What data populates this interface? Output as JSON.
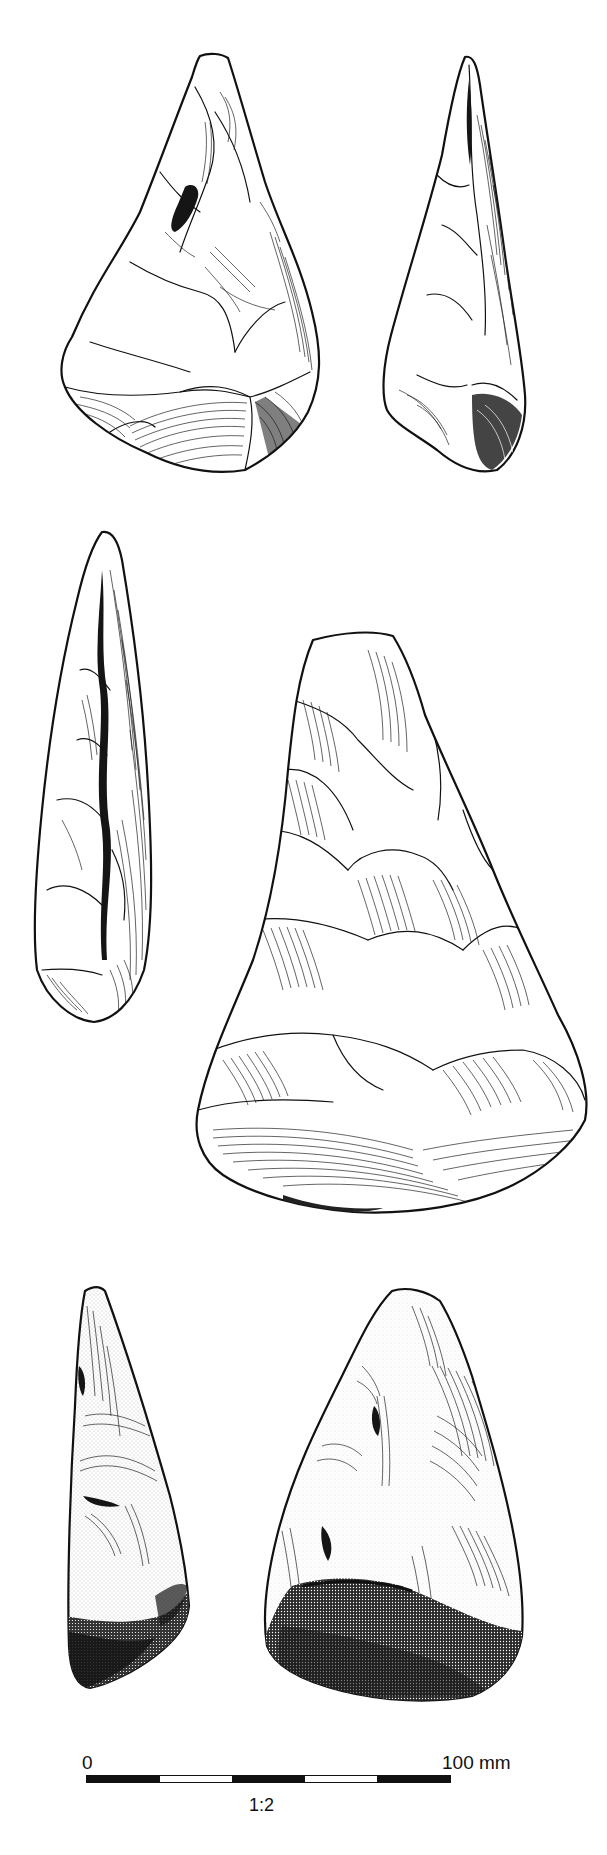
{
  "figure": {
    "artifacts": [
      {
        "id": "a1",
        "view": "face",
        "row": 1,
        "col": 1,
        "rendering": "line-hatched"
      },
      {
        "id": "a2",
        "view": "profile",
        "row": 1,
        "col": 2,
        "rendering": "line-hatched"
      },
      {
        "id": "a3",
        "view": "profile",
        "row": 2,
        "col": 1,
        "rendering": "line-hatched"
      },
      {
        "id": "a4",
        "view": "face",
        "row": 2,
        "col": 2,
        "rendering": "line-hatched"
      },
      {
        "id": "a5",
        "view": "profile",
        "row": 3,
        "col": 1,
        "rendering": "stippled"
      },
      {
        "id": "a6",
        "view": "face",
        "row": 3,
        "col": 2,
        "rendering": "stippled"
      }
    ]
  },
  "scale_bar": {
    "start_label": "0",
    "end_label": "100 mm",
    "ratio_label": "1:2",
    "segments": [
      "black",
      "white",
      "black",
      "white",
      "black"
    ],
    "colors": {
      "ink": "#111111",
      "paper": "#ffffff"
    }
  }
}
